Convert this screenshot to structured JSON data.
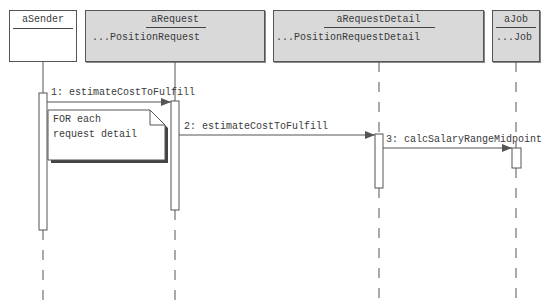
{
  "objects": [
    {
      "id": "aSender",
      "name": "aSender",
      "class": ""
    },
    {
      "id": "aRequest",
      "name": "aRequest",
      "class": "...PositionRequest"
    },
    {
      "id": "aRequestDetail",
      "name": "aRequestDetail",
      "class": "...PositionRequestDetail"
    },
    {
      "id": "aJob",
      "name": "aJob",
      "class": "...Job"
    }
  ],
  "messages": [
    {
      "number": "1",
      "label": "1: estimateCostToFulfill",
      "from": "aSender",
      "to": "aRequest"
    },
    {
      "number": "2",
      "label": "2: estimateCostToFulfill",
      "from": "aRequest",
      "to": "aRequestDetail"
    },
    {
      "number": "3",
      "label": "3: calcSalaryRangeMidpoint",
      "from": "aRequestDetail",
      "to": "aJob"
    }
  ],
  "note": {
    "line1": "FOR each",
    "line2": "request detail"
  },
  "colors": {
    "object_fill": "#d9d9d9",
    "sender_fill": "#ffffff",
    "line": "#555555",
    "text": "#3a3a3a"
  }
}
